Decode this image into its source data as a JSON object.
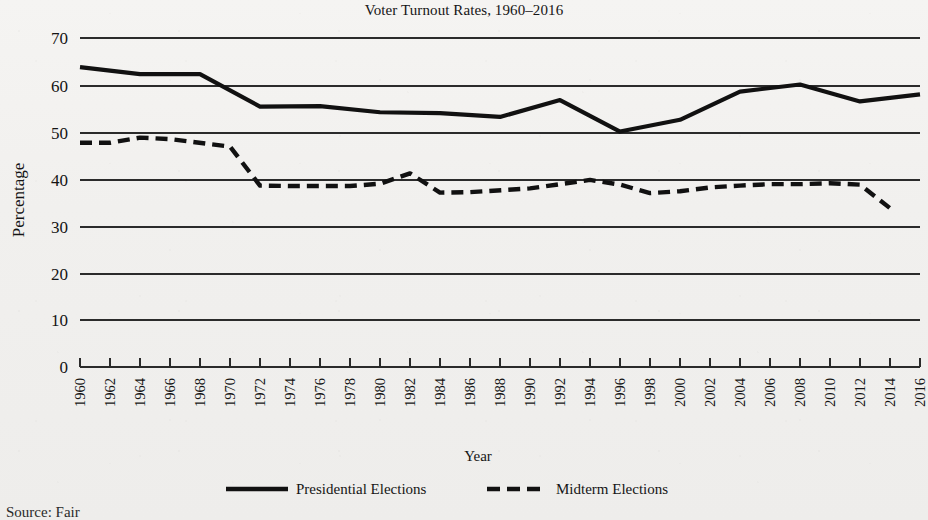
{
  "chart_data": {
    "type": "line",
    "title": "Voter Turnout Rates, 1960–2016",
    "xlabel": "Year",
    "ylabel": "Percentage",
    "ylim": [
      0,
      70
    ],
    "yticks": [
      0,
      10,
      20,
      30,
      40,
      50,
      60,
      70
    ],
    "grid": "horizontal",
    "legend_position": "bottom",
    "x": [
      1960,
      1962,
      1964,
      1966,
      1968,
      1970,
      1972,
      1974,
      1976,
      1978,
      1980,
      1982,
      1984,
      1986,
      1988,
      1990,
      1992,
      1994,
      1996,
      1998,
      2000,
      2002,
      2004,
      2006,
      2008,
      2010,
      2012,
      2014,
      2016
    ],
    "categories": [
      "1960",
      "1962",
      "1964",
      "1966",
      "1968",
      "1970",
      "1972",
      "1974",
      "1976",
      "1978",
      "1980",
      "1982",
      "1984",
      "1986",
      "1988",
      "1990",
      "1992",
      "1994",
      "1996",
      "1998",
      "2000",
      "2002",
      "2004",
      "2006",
      "2008",
      "2010",
      "2012",
      "2014",
      "2016"
    ],
    "series": [
      {
        "name": "Presidential Elections",
        "style": "solid",
        "color": "#111111",
        "points": [
          {
            "x": 1960,
            "y": 63.8
          },
          {
            "x": 1964,
            "y": 62.3
          },
          {
            "x": 1968,
            "y": 62.3
          },
          {
            "x": 1972,
            "y": 55.4
          },
          {
            "x": 1976,
            "y": 55.5
          },
          {
            "x": 1980,
            "y": 54.2
          },
          {
            "x": 1984,
            "y": 54.0
          },
          {
            "x": 1988,
            "y": 53.2
          },
          {
            "x": 1992,
            "y": 56.8
          },
          {
            "x": 1996,
            "y": 50.1
          },
          {
            "x": 2000,
            "y": 52.6
          },
          {
            "x": 2004,
            "y": 58.6
          },
          {
            "x": 2008,
            "y": 60.1
          },
          {
            "x": 2012,
            "y": 56.5
          },
          {
            "x": 2016,
            "y": 58.0
          }
        ]
      },
      {
        "name": "Midterm Elections",
        "style": "dashed",
        "color": "#111111",
        "points": [
          {
            "x": 1960,
            "y": 47.7
          },
          {
            "x": 1962,
            "y": 47.7
          },
          {
            "x": 1964,
            "y": 48.8
          },
          {
            "x": 1966,
            "y": 48.5
          },
          {
            "x": 1970,
            "y": 46.9
          },
          {
            "x": 1972,
            "y": 38.6
          },
          {
            "x": 1974,
            "y": 38.5
          },
          {
            "x": 1978,
            "y": 38.5
          },
          {
            "x": 1980,
            "y": 39.0
          },
          {
            "x": 1982,
            "y": 41.2
          },
          {
            "x": 1984,
            "y": 37.1
          },
          {
            "x": 1986,
            "y": 37.2
          },
          {
            "x": 1990,
            "y": 38.0
          },
          {
            "x": 1994,
            "y": 39.8
          },
          {
            "x": 1996,
            "y": 38.8
          },
          {
            "x": 1998,
            "y": 37.0
          },
          {
            "x": 2000,
            "y": 37.4
          },
          {
            "x": 2002,
            "y": 38.2
          },
          {
            "x": 2004,
            "y": 38.6
          },
          {
            "x": 2006,
            "y": 38.9
          },
          {
            "x": 2008,
            "y": 38.9
          },
          {
            "x": 2010,
            "y": 39.1
          },
          {
            "x": 2012,
            "y": 38.8
          },
          {
            "x": 2014,
            "y": 33.8
          }
        ]
      }
    ]
  },
  "legend": {
    "items": [
      {
        "label": "Presidential Elections",
        "style": "solid"
      },
      {
        "label": "Midterm Elections",
        "style": "dashed"
      }
    ]
  },
  "source_note": "Source: Fair"
}
